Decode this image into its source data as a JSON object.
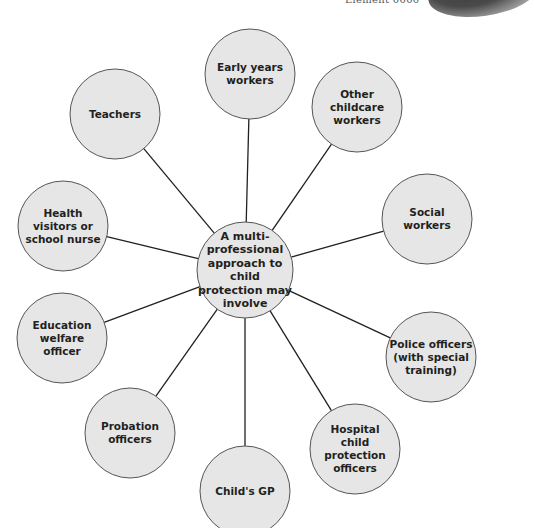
{
  "header": {
    "element_label": "Element 0000"
  },
  "colors": {
    "node_fill": "#e6e6e6",
    "node_stroke": "#555555",
    "line": "#231f20",
    "text": "#231f20"
  },
  "center": {
    "label": "A multi-\nprofessional\napproach to child\nprotection may\ninvolve",
    "cx": 245,
    "cy": 270,
    "r": 48
  },
  "nodes": [
    {
      "id": "early-years-workers",
      "label": "Early years\nworkers",
      "cx": 250,
      "cy": 74,
      "r": 45
    },
    {
      "id": "other-childcare-workers",
      "label": "Other\nchildcare\nworkers",
      "cx": 357,
      "cy": 107,
      "r": 45
    },
    {
      "id": "social-workers",
      "label": "Social\nworkers",
      "cx": 427,
      "cy": 219,
      "r": 45
    },
    {
      "id": "police-officers",
      "label": "Police officers\n(with special\ntraining)",
      "cx": 431,
      "cy": 357,
      "r": 45
    },
    {
      "id": "hospital-child-protection-officers",
      "label": "Hospital\nchild protection\nofficers",
      "cx": 355,
      "cy": 449,
      "r": 45
    },
    {
      "id": "childs-gp",
      "label": "Child's GP",
      "cx": 245,
      "cy": 491,
      "r": 45
    },
    {
      "id": "probation-officers",
      "label": "Probation\nofficers",
      "cx": 130,
      "cy": 433,
      "r": 45
    },
    {
      "id": "education-welfare-officer",
      "label": "Education\nwelfare\nofficer",
      "cx": 62,
      "cy": 338,
      "r": 45
    },
    {
      "id": "health-visitors-or-school-nurse",
      "label": "Health\nvisitors or\nschool nurse",
      "cx": 63,
      "cy": 226,
      "r": 45
    },
    {
      "id": "teachers",
      "label": "Teachers",
      "cx": 115,
      "cy": 114,
      "r": 45
    }
  ]
}
